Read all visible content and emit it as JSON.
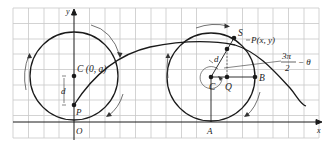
{
  "diagram": {
    "type": "trochoid-construction",
    "colors": {
      "grid": "#c8c8c8",
      "stroke": "#1a1a1a",
      "arrow": "#333333",
      "background": "#ffffff"
    },
    "axes": {
      "x_label": "x",
      "y_label": "y"
    },
    "labels": {
      "left_center": "C (0, a)",
      "left_d": "d",
      "left_P": "P",
      "origin": "O",
      "right_S": "S",
      "right_P": "P(x, y)",
      "right_d": "d",
      "right_C": "C",
      "right_Q": "Q",
      "right_B": "B",
      "right_A": "A",
      "angle_num": "3π",
      "angle_den": "2",
      "angle_rest": "− θ"
    }
  }
}
